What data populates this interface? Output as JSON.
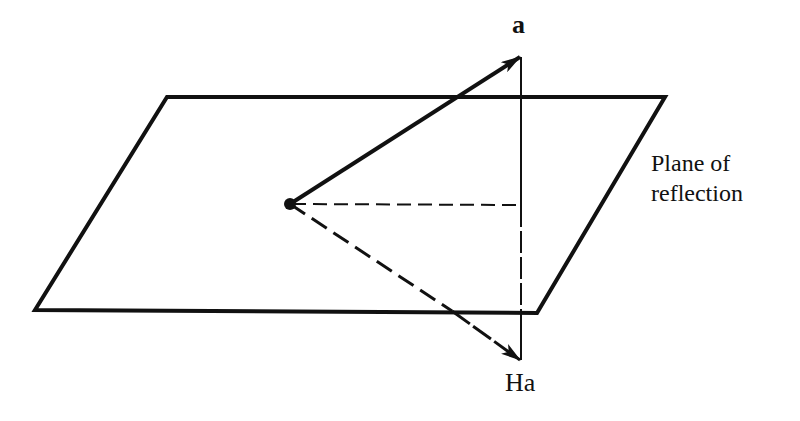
{
  "figure": {
    "type": "reflection-diagram",
    "labels": {
      "vector": "a",
      "reflected_vector": "Ha",
      "plane_line1": "Plane of",
      "plane_line2": "reflection"
    },
    "colors": {
      "ink": "#111111",
      "background": "#ffffff"
    },
    "geometry": {
      "plane_corners": [
        [
          167,
          97
        ],
        [
          665,
          97
        ],
        [
          537,
          313
        ],
        [
          35,
          310
        ]
      ],
      "origin": [
        290,
        204
      ],
      "vector_a_tip": [
        520,
        57
      ],
      "vector_ha_tip": [
        520,
        360
      ],
      "projection_foot": [
        521,
        205
      ]
    }
  }
}
